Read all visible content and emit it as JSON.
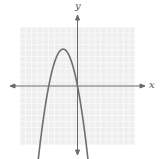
{
  "chart_data": {
    "type": "line",
    "title": "",
    "xlabel": "x",
    "ylabel": "y",
    "grid": true,
    "xlim": [
      -10,
      10
    ],
    "ylim": [
      -10,
      10
    ],
    "series": [
      {
        "name": "parabola",
        "equation": "y = -x^2 - 5x",
        "vertex": [
          -2.5,
          6.25
        ],
        "x_intercepts": [
          -5,
          0
        ],
        "opens": "down",
        "color": "#666666"
      }
    ]
  },
  "labels": {
    "x_axis": "x",
    "y_axis": "y"
  },
  "colors": {
    "grid": "#e2e2e2",
    "grid_bg": "#efefef",
    "axis": "#6a6a6a",
    "curve": "#6e6e6e"
  }
}
